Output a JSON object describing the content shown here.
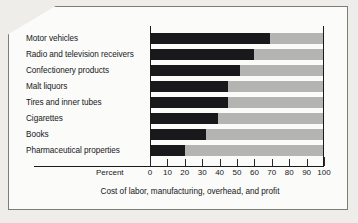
{
  "chart_data": {
    "type": "bar",
    "orientation": "horizontal",
    "stacked": true,
    "title": "",
    "subtitle": "",
    "xlabel": "Percent",
    "ylabel": "",
    "caption": "Cost of labor, manufacturing, overhead, and profit",
    "xlim": [
      0,
      100
    ],
    "xticks": [
      0,
      10,
      20,
      30,
      40,
      50,
      60,
      70,
      80,
      90,
      100
    ],
    "xtick_labels": [
      "0",
      "10",
      "20",
      "30",
      "40",
      "50",
      "60",
      "70",
      "80",
      "90",
      "100"
    ],
    "grid": false,
    "legend": "none",
    "categories": [
      "Motor vehicles",
      "Radio and television receivers",
      "Confectionery products",
      "Malt liquors",
      "Tires and inner tubes",
      "Cigarettes",
      "Books",
      "Pharmaceutical properties"
    ],
    "series": [
      {
        "name": "Cost of labor, manufacturing, overhead, and profit",
        "color": "#19191b",
        "values": [
          69,
          60,
          52,
          45,
          45,
          39,
          32,
          20
        ]
      },
      {
        "name": "Remainder",
        "color": "#b4b4b2",
        "values": [
          31,
          40,
          48,
          55,
          55,
          61,
          68,
          80
        ]
      }
    ],
    "bar_color_dark": "#19191b",
    "bar_color_light": "#b4b4b2"
  },
  "axis": {
    "percent_label": "Percent"
  },
  "colors": {
    "ink": "#17171a",
    "frame_border": "#7d7d78",
    "card_bg": "#fbfbf9",
    "page_bg": "#eeedea"
  }
}
